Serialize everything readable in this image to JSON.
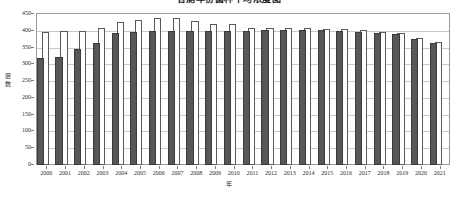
{
  "chart_data": {
    "type": "bar",
    "title": "各测年份菌种平均浓度图",
    "xlabel": "年",
    "ylabel": "层数",
    "ylim": [
      0,
      450
    ],
    "yticks": [
      0,
      50,
      100,
      150,
      200,
      250,
      300,
      350,
      400,
      450
    ],
    "grid": true,
    "legend": "",
    "categories": [
      "2000",
      "2001",
      "2002",
      "2003",
      "2004",
      "2005",
      "2006",
      "2007",
      "2008",
      "2009",
      "2010",
      "2011",
      "2012",
      "2013",
      "2014",
      "2015",
      "2016",
      "2017",
      "2018",
      "2019",
      "2020",
      "2021"
    ],
    "series": [
      {
        "name": "series-dark",
        "color": "#575757",
        "values": [
          320,
          323,
          346,
          365,
          394,
          396,
          399,
          400,
          400,
          400,
          400,
          400,
          402,
          402,
          403,
          401,
          400,
          397,
          393,
          390,
          376,
          363
        ]
      },
      {
        "name": "series-light",
        "color": "#ffffff",
        "values": [
          397,
          398,
          399,
          408,
          425,
          433,
          439,
          437,
          430,
          419,
          421,
          407,
          407,
          407,
          409,
          406,
          404,
          401,
          396,
          393,
          379,
          366
        ]
      }
    ]
  }
}
